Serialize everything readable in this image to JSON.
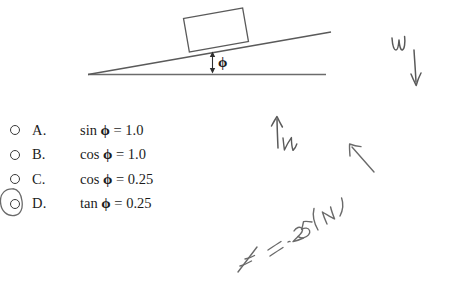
{
  "page": {
    "background_color": "#ffffff",
    "ink_color": "#555555",
    "print_color": "#1c1c1c"
  },
  "diagram": {
    "name": "inclined-plane-diagram",
    "block_label": "",
    "angle_symbol": "ϕ"
  },
  "options": {
    "items": [
      {
        "letter": "A.",
        "text_prefix": "sin ",
        "symbol": "ϕ",
        "text_suffix": " = 1.0",
        "selected": false
      },
      {
        "letter": "B.",
        "text_prefix": "cos ",
        "symbol": "ϕ",
        "text_suffix": " = 1.0",
        "selected": false
      },
      {
        "letter": "C.",
        "text_prefix": "cos ",
        "symbol": "ϕ",
        "text_suffix": " = 0.25",
        "selected": false
      },
      {
        "letter": "D.",
        "text_prefix": "tan ",
        "symbol": "ϕ",
        "text_suffix": " = 0.25",
        "selected": true
      }
    ]
  },
  "annotations": {
    "weight_label": "W",
    "normal_label": "N",
    "equation": "F = .25(N)"
  }
}
